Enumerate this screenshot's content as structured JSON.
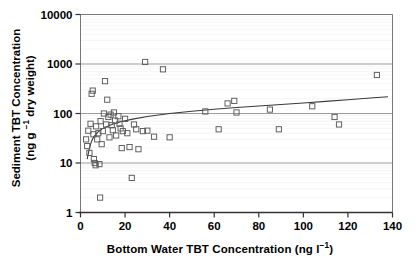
{
  "chart_data": {
    "type": "scatter",
    "title": "",
    "xlabel": "Bottom Water TBT Concentration (ng l⁻¹)",
    "ylabel_line1": "Sediment TBT Concentration",
    "ylabel_line2": "(ng g ⁻¹ dry weight)",
    "xlabel_plain": "Bottom Water TBT Concentration (ng l-1)",
    "ylabel_plain": "Sediment TBT Concentration (ng g-1 dry weight)",
    "xscale": "linear",
    "yscale": "log",
    "xlim": [
      0,
      140
    ],
    "ylim": [
      1,
      10000
    ],
    "xticks": [
      0,
      20,
      40,
      60,
      80,
      100,
      120,
      140
    ],
    "xtick_labels": [
      "0",
      "20",
      "40",
      "60",
      "80",
      "100",
      "120",
      "140"
    ],
    "yticks": [
      1,
      10,
      100,
      1000,
      10000
    ],
    "ytick_labels": [
      "1",
      "10",
      "100",
      "1000",
      "10000"
    ],
    "grid": "major horizontal decade lines plus faint minor log lines",
    "legend": "none",
    "marker": "open square",
    "marker_color": "#5a5a5a",
    "marker_facecolor": "none",
    "line_color": "#3a3a3a",
    "frame_color": "#777777",
    "points": [
      [
        2.5,
        30
      ],
      [
        3.0,
        22
      ],
      [
        3.5,
        45
      ],
      [
        4.0,
        16
      ],
      [
        4.5,
        62
      ],
      [
        5.0,
        250
      ],
      [
        5.5,
        290
      ],
      [
        5.8,
        38
      ],
      [
        6.0,
        12
      ],
      [
        6.4,
        10
      ],
      [
        6.8,
        9
      ],
      [
        7.0,
        55
      ],
      [
        7.5,
        30
      ],
      [
        8.0,
        40
      ],
      [
        8.5,
        9.5
      ],
      [
        8.8,
        2
      ],
      [
        9.0,
        70
      ],
      [
        9.5,
        24
      ],
      [
        10.0,
        44
      ],
      [
        10.5,
        100
      ],
      [
        11.0,
        450
      ],
      [
        11.5,
        60
      ],
      [
        12.0,
        190
      ],
      [
        12.5,
        85
      ],
      [
        13.0,
        33
      ],
      [
        13.5,
        95
      ],
      [
        14.0,
        58
      ],
      [
        14.5,
        46
      ],
      [
        15.0,
        105
      ],
      [
        15.5,
        72
      ],
      [
        16.0,
        36
      ],
      [
        17.0,
        88
      ],
      [
        17.5,
        62
      ],
      [
        18.0,
        50
      ],
      [
        18.5,
        20
      ],
      [
        19.0,
        44
      ],
      [
        20.0,
        78
      ],
      [
        21.0,
        40
      ],
      [
        22.0,
        21
      ],
      [
        23.0,
        5
      ],
      [
        24.0,
        60
      ],
      [
        25.0,
        48
      ],
      [
        26.0,
        19
      ],
      [
        28.0,
        44
      ],
      [
        29.0,
        1100
      ],
      [
        30.0,
        45
      ],
      [
        33.0,
        34
      ],
      [
        37.0,
        780
      ],
      [
        40.0,
        33
      ],
      [
        56.0,
        110
      ],
      [
        62.0,
        48
      ],
      [
        66.0,
        160
      ],
      [
        69.0,
        180
      ],
      [
        70.0,
        105
      ],
      [
        85.0,
        120
      ],
      [
        89.0,
        48
      ],
      [
        104.0,
        140
      ],
      [
        114.0,
        85
      ],
      [
        116.0,
        60
      ],
      [
        133.0,
        600
      ]
    ],
    "fit_line": {
      "description": "logarithmic regression curve rising from ~12 at x=3 to ~220 at x=140",
      "points": [
        [
          3.0,
          12
        ],
        [
          4.0,
          20
        ],
        [
          5.0,
          28
        ],
        [
          6.0,
          34
        ],
        [
          8.0,
          43
        ],
        [
          10.0,
          50
        ],
        [
          14.0,
          60
        ],
        [
          18.0,
          68
        ],
        [
          24.0,
          78
        ],
        [
          30.0,
          87
        ],
        [
          40.0,
          100
        ],
        [
          50.0,
          111
        ],
        [
          60.0,
          122
        ],
        [
          70.0,
          132
        ],
        [
          80.0,
          142
        ],
        [
          90.0,
          152
        ],
        [
          100.0,
          163
        ],
        [
          110.0,
          176
        ],
        [
          120.0,
          190
        ],
        [
          130.0,
          205
        ],
        [
          138.0,
          218
        ]
      ]
    }
  }
}
